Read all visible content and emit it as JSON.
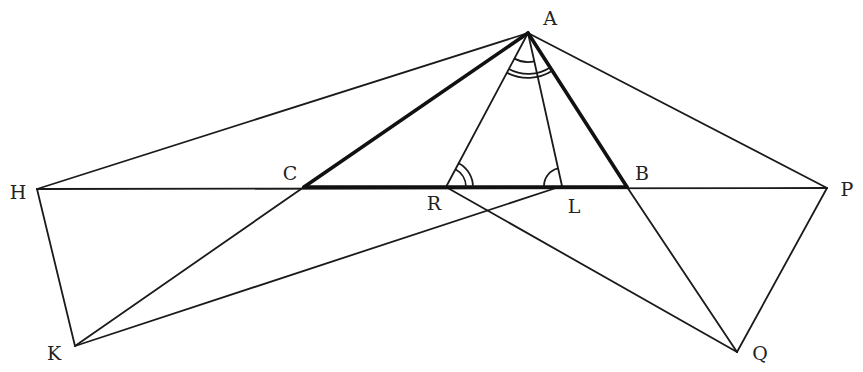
{
  "diagram": {
    "title": "",
    "points": {
      "A": {
        "label": "A",
        "x": 528,
        "y": 33,
        "lx": 550,
        "ly": 18
      },
      "B": {
        "label": "B",
        "x": 627,
        "y": 187,
        "lx": 642,
        "ly": 173
      },
      "C": {
        "label": "C",
        "x": 304,
        "y": 187,
        "lx": 290,
        "ly": 173
      },
      "R": {
        "label": "R",
        "x": 446,
        "y": 187,
        "lx": 436,
        "ly": 203
      },
      "L": {
        "label": "L",
        "x": 562,
        "y": 186,
        "lx": 574,
        "ly": 204
      },
      "H": {
        "label": "H",
        "x": 37,
        "y": 189,
        "lx": 18,
        "ly": 191
      },
      "P": {
        "label": "P",
        "x": 827,
        "y": 188,
        "lx": 847,
        "ly": 188
      },
      "K": {
        "label": "K",
        "x": 75,
        "y": 346,
        "lx": 54,
        "ly": 353
      },
      "Q": {
        "label": "Q",
        "x": 737,
        "y": 352,
        "lx": 760,
        "ly": 352
      }
    },
    "segments_bold": [
      "AB",
      "AC",
      "CB"
    ],
    "segments_thin": [
      "HP",
      "AH",
      "AP",
      "AR",
      "AL",
      "HK",
      "KC",
      "KL",
      "RQ",
      "BQ",
      "PQ"
    ],
    "angle_marks": [
      {
        "vertex": "A",
        "type": "single-arc",
        "between": [
          "AR",
          "AL"
        ]
      },
      {
        "vertex": "A",
        "type": "double-arc",
        "between": [
          "AC",
          "AB"
        ]
      },
      {
        "vertex": "R",
        "type": "double-arc",
        "between": [
          "RL",
          "RA"
        ]
      },
      {
        "vertex": "L",
        "type": "single-arc",
        "between": [
          "LR",
          "LA"
        ]
      }
    ],
    "colors": {
      "line": "#1a1a1a",
      "background": "#ffffff"
    }
  }
}
